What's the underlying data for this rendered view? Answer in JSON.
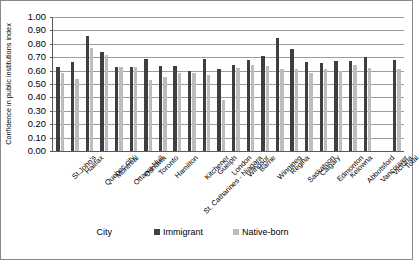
{
  "chart_data": {
    "type": "bar",
    "title": "",
    "xlabel": "City",
    "ylabel": "Confidence in public institutions index",
    "ylim": [
      0.0,
      1.0
    ],
    "ytick_labels": [
      "1.00",
      "0.90",
      "0.80",
      "0.70",
      "0.60",
      "0.50",
      "0.40",
      "0.30",
      "0.20",
      "0.10",
      "0.00"
    ],
    "ytick_values": [
      1.0,
      0.9,
      0.8,
      0.7,
      0.6,
      0.5,
      0.4,
      0.3,
      0.2,
      0.1,
      0.0
    ],
    "grid": true,
    "legend_position": "bottom",
    "categories": [
      "St.John's",
      "Halifax",
      "Quebec city",
      "Montreal",
      "Ottawa-Hull",
      "Oshawa",
      "Toronto",
      "Hamilton",
      "St. Catharines - Niagara",
      "Kitchener",
      "Guelph",
      "London",
      "Windsor",
      "Barrie",
      "Winnipeg",
      "Regina",
      "Saskatoon",
      "Calgary",
      "Edmonton",
      "Kelowna",
      "Abbotsford",
      "Vancouver",
      "Victoria",
      "Total"
    ],
    "series": [
      {
        "name": "Immigrant",
        "color": "#3f3f3f",
        "values": [
          0.63,
          0.665,
          0.86,
          0.74,
          0.63,
          0.63,
          0.685,
          0.635,
          0.635,
          0.595,
          0.69,
          0.615,
          0.64,
          0.68,
          0.71,
          0.84,
          0.76,
          0.665,
          0.655,
          0.675,
          0.675,
          0.7,
          0.0,
          0.68
        ]
      },
      {
        "name": "Native-born",
        "color": "#bdbdbd",
        "values": [
          0.58,
          0.54,
          0.77,
          0.72,
          0.63,
          0.63,
          0.53,
          0.55,
          0.58,
          0.58,
          0.57,
          0.38,
          0.62,
          0.645,
          0.635,
          0.615,
          0.61,
          0.585,
          0.61,
          0.6,
          0.645,
          0.62,
          0.0,
          0.615
        ]
      }
    ]
  },
  "legend": {
    "items": [
      {
        "label": "Immigrant"
      },
      {
        "label": "Native-born"
      }
    ]
  }
}
